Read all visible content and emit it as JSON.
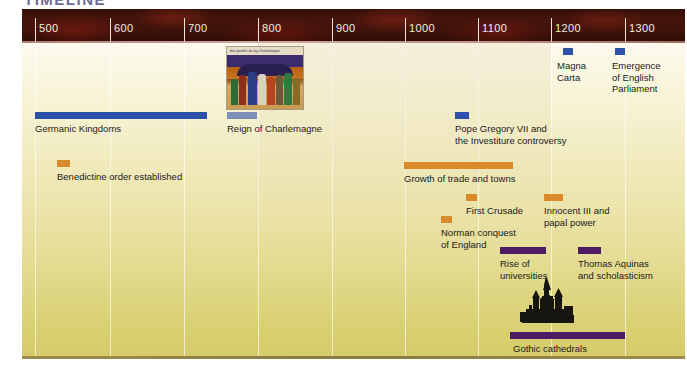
{
  "title": "TIMELINE",
  "axis": {
    "ticks": [
      {
        "label": "500",
        "x": 35
      },
      {
        "label": "600",
        "x": 110
      },
      {
        "label": "700",
        "x": 184
      },
      {
        "label": "800",
        "x": 258
      },
      {
        "label": "900",
        "x": 332
      },
      {
        "label": "1000",
        "x": 405
      },
      {
        "label": "1100",
        "x": 478
      },
      {
        "label": "1200",
        "x": 551
      },
      {
        "label": "1300",
        "x": 625
      }
    ]
  },
  "colors": {
    "blue": "#2d50a8",
    "orange": "#d98a2b",
    "purple": "#4c1b63",
    "axis_band": "#3d120a",
    "body_top": "#fdfaee",
    "body_bottom": "#d5cb69",
    "title": "#6e6a94"
  },
  "chart_data": {
    "type": "timeline",
    "title": "TIMELINE",
    "xlabel": "",
    "ylabel": "",
    "xlim": [
      450,
      1350
    ],
    "axis_ticks": [
      500,
      600,
      700,
      800,
      900,
      1000,
      1100,
      1200,
      1300
    ],
    "grid": true,
    "legend": "none",
    "categories": [
      "political",
      "economic-religious",
      "cultural-intellectual"
    ],
    "category_colors": {
      "political": "#2d50a8",
      "economic-religious": "#d98a2b",
      "cultural-intellectual": "#4c1b63"
    },
    "events": [
      {
        "label": "Germanic Kingdoms",
        "category": "political",
        "color": "#2d50a8",
        "kind": "span",
        "start": 468,
        "end": 700,
        "bar": {
          "left": 35,
          "width": 172,
          "top": 69
        },
        "label_pos": {
          "left": 35,
          "top": 80
        }
      },
      {
        "label": "Reign of Charlemagne",
        "category": "political",
        "color": "#2d50a8",
        "kind": "span",
        "start": 768,
        "end": 814,
        "bar": {
          "left": 227,
          "width": 30,
          "top": 69
        },
        "label_pos": {
          "left": 227,
          "top": 80
        },
        "has_image": true
      },
      {
        "label": "Benedictine order established",
        "category": "economic-religious",
        "color": "#d98a2b",
        "kind": "point",
        "start": 529,
        "end": 540,
        "bar": {
          "left": 57,
          "width": 13,
          "top": 117
        },
        "label_pos": {
          "left": 57,
          "top": 128
        }
      },
      {
        "label": "Pope Gregory VII and\nthe Investiture controversy",
        "category": "political",
        "color": "#2d50a8",
        "kind": "point",
        "start": 1073,
        "end": 1085,
        "bar": {
          "left": 455,
          "width": 14,
          "top": 69
        },
        "label_pos": {
          "left": 455,
          "top": 80
        }
      },
      {
        "label": "Growth of trade and towns",
        "category": "economic-religious",
        "color": "#d98a2b",
        "kind": "span",
        "start": 1000,
        "end": 1148,
        "bar": {
          "left": 404,
          "width": 109,
          "top": 119
        },
        "label_pos": {
          "left": 404,
          "top": 130
        }
      },
      {
        "label": "First Crusade",
        "category": "economic-religious",
        "color": "#d98a2b",
        "kind": "point",
        "start": 1096,
        "end": 1099,
        "bar": {
          "left": 466,
          "width": 11,
          "top": 151
        },
        "label_pos": {
          "left": 466,
          "top": 162
        }
      },
      {
        "label": "Norman conquest\nof England",
        "category": "economic-religious",
        "color": "#d98a2b",
        "kind": "point",
        "start": 1066,
        "end": 1070,
        "bar": {
          "left": 441,
          "width": 11,
          "top": 173
        },
        "label_pos": {
          "left": 441,
          "top": 184
        }
      },
      {
        "label": "Innocent III and\npapal power",
        "category": "economic-religious",
        "color": "#d98a2b",
        "kind": "point",
        "start": 1198,
        "end": 1216,
        "bar": {
          "left": 544,
          "width": 19,
          "top": 151
        },
        "label_pos": {
          "left": 544,
          "top": 162
        }
      },
      {
        "label": "Magna\nCarta",
        "category": "political",
        "color": "#2d50a8",
        "kind": "point",
        "start": 1215,
        "end": 1218,
        "bar": {
          "left": 563,
          "width": 10,
          "top": 5
        },
        "label_pos": {
          "left": 557,
          "top": 17
        }
      },
      {
        "label": "Emergence\nof English\nParliament",
        "category": "political",
        "color": "#2d50a8",
        "kind": "point",
        "start": 1295,
        "end": 1300,
        "bar": {
          "left": 615,
          "width": 10,
          "top": 5
        },
        "label_pos": {
          "left": 612,
          "top": 17
        }
      },
      {
        "label": "Rise of\nuniversities",
        "category": "cultural-intellectual",
        "color": "#4c1b63",
        "kind": "span",
        "start": 1150,
        "end": 1215,
        "bar": {
          "left": 500,
          "width": 46,
          "top": 204
        },
        "label_pos": {
          "left": 500,
          "top": 215
        }
      },
      {
        "label": "Thomas Aquinas\nand scholasticism",
        "category": "cultural-intellectual",
        "color": "#4c1b63",
        "kind": "span",
        "start": 1255,
        "end": 1280,
        "bar": {
          "left": 578,
          "width": 23,
          "top": 204
        },
        "label_pos": {
          "left": 578,
          "top": 215
        }
      },
      {
        "label": "Gothic cathedrals",
        "category": "cultural-intellectual",
        "color": "#4c1b63",
        "kind": "span",
        "start": 1145,
        "end": 1300,
        "bar": {
          "left": 510,
          "width": 115,
          "top": 289
        },
        "label_pos": {
          "left": 513,
          "top": 300
        },
        "has_image": true
      }
    ]
  },
  "images": {
    "charlemagne": {
      "name": "reign-of-charlemagne-manuscript",
      "caption": "des paroles du roy Charlemaigne"
    },
    "cathedral": {
      "name": "gothic-cathedral-silhouette"
    }
  }
}
